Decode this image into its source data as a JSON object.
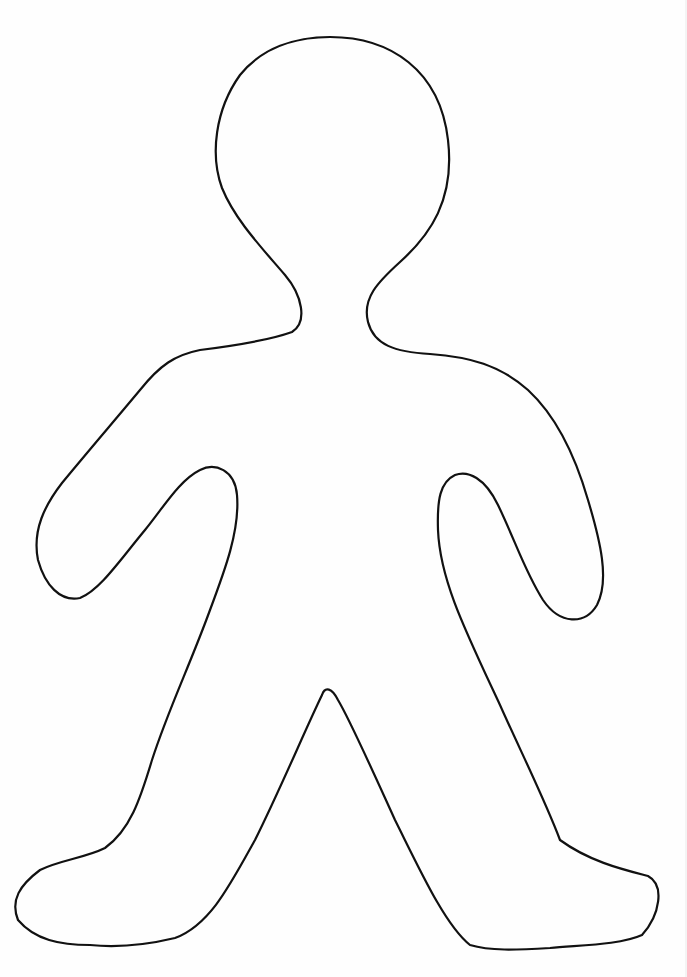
{
  "page": {
    "background": "#fefefe",
    "width": 687,
    "height": 977
  },
  "figure": {
    "label": "",
    "type": "person-outline-template",
    "stroke_color": "#111111",
    "stroke_width": 2.2,
    "fill": "none",
    "outline_path": "M 330 37 C 390 37, 440 70, 448 140 C 455 200, 430 235, 400 262 C 378 282, 362 298, 368 322 C 374 345, 395 352, 430 354 C 470 357, 500 365, 528 390 C 555 415, 575 455, 588 500 C 600 540, 610 580, 597 605 C 585 625, 560 625, 543 600 C 525 572, 515 540, 498 505 C 485 478, 468 470, 455 475 C 440 482, 437 500, 438 530 C 440 580, 465 630, 500 705 C 520 750, 545 800, 560 840 C 590 862, 625 870, 648 876 C 665 885, 660 915, 642 935 C 620 945, 580 945, 550 948 C 515 950, 490 951, 470 945 C 445 925, 420 870, 395 820 C 370 765, 350 720, 338 700 C 332 688, 325 686, 322 695 C 305 730, 280 790, 255 840 C 230 885, 210 925, 175 938 C 150 944, 120 948, 90 945 C 60 945, 35 940, 18 920 C 10 900, 20 885, 40 870 C 60 860, 85 858, 105 848 C 130 830, 140 800, 152 760 C 168 710, 190 665, 210 610 C 225 570, 240 530, 237 495 C 235 470, 215 462, 200 470 C 180 480, 165 505, 145 530 C 120 560, 100 590, 80 598 C 60 602, 45 585, 38 560 C 32 530, 45 505, 62 483 C 85 455, 115 420, 140 390 C 160 365, 175 355, 200 350 C 240 345, 270 340, 292 332 C 308 322, 302 295, 285 275 C 262 248, 235 220, 222 188 C 210 155, 215 110, 240 75 C 262 48, 295 37, 330 37 Z"
  }
}
